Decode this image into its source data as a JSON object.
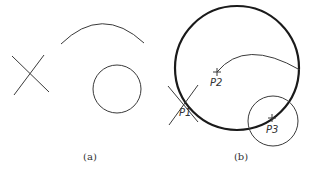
{
  "figure": {
    "panel_a": {
      "caption": "(a)"
    },
    "panel_b": {
      "caption": "(b)",
      "points": [
        {
          "label": "P1"
        },
        {
          "label": "P2"
        },
        {
          "label": "P3"
        }
      ]
    }
  }
}
